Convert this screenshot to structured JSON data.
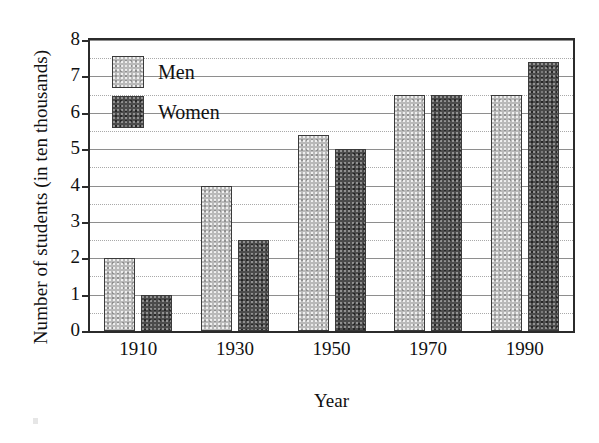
{
  "chart_data": {
    "type": "bar",
    "title": "",
    "xlabel": "Year",
    "ylabel": "Number of students (in ten thousands)",
    "categories": [
      "1910",
      "1930",
      "1950",
      "1970",
      "1990"
    ],
    "series": [
      {
        "name": "Men",
        "color": "#b9b9b9",
        "values": [
          2.0,
          4.0,
          5.4,
          6.5,
          6.5
        ]
      },
      {
        "name": "Women",
        "color": "#4b4b4b",
        "values": [
          1.0,
          2.5,
          5.0,
          6.5,
          7.4
        ]
      }
    ],
    "ylim": [
      0,
      8
    ],
    "ytick_labels": [
      "0",
      "1",
      "2",
      "3",
      "4",
      "5",
      "6",
      "7",
      "8"
    ],
    "ytick_values": [
      0,
      1,
      2,
      3,
      4,
      5,
      6,
      7,
      8
    ],
    "minor_tick_values": [
      0.5,
      1.5,
      2.5,
      3.5,
      4.5,
      5.5,
      6.5,
      7.5
    ],
    "grid": true,
    "grid_style": "major solid gray, minor dotted gray",
    "legend_position": "upper left inside plot",
    "axis_color": "#2b2b2b",
    "background": "#ffffff"
  },
  "legend": {
    "items": [
      {
        "label": "Men",
        "swatch": "men-swatch"
      },
      {
        "label": "Women",
        "swatch": "women-swatch"
      }
    ]
  }
}
